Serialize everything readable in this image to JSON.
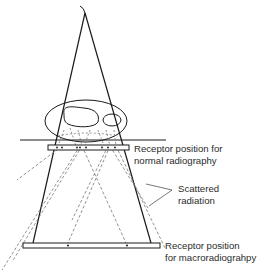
{
  "diagram": {
    "type": "macroradiography-geometry",
    "labels": {
      "normal_receptor_line1": "Receptor position for",
      "normal_receptor_line2": "normal radiography",
      "scattered_line1": "Scattered",
      "scattered_line2": "radiation",
      "macro_receptor_line1": "Receptor position",
      "macro_receptor_line2": "for macroradiograhpy"
    },
    "colors": {
      "line": "#1a1a1a",
      "dashed": "#777777",
      "text": "#2b2b2b",
      "background": "#ffffff"
    }
  }
}
